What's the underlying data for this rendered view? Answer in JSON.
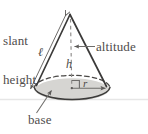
{
  "figure": {
    "type": "geometry-diagram",
    "shape": "cone",
    "background_color": "#ffffff"
  },
  "labels": {
    "slant_height_line1": "slant",
    "slant_height_line2": "height",
    "altitude": "altitude",
    "base": "base",
    "slant_symbol": "ℓ",
    "height_symbol": "h",
    "radius_symbol": "r"
  },
  "colors": {
    "outline": "#3b3a39",
    "base_fill": "#d6d5d2",
    "base_fill_edge": "#c9c8c5",
    "dashed_line": "#8e8c8a",
    "leader_line": "#6e6c6a",
    "text": "#4f4d4c",
    "ground_line": "#e4e4e4"
  },
  "geometry": {
    "apex": {
      "x": 70,
      "y": 14
    },
    "base_center": {
      "x": 72,
      "y": 88
    },
    "base_rx": 38,
    "base_ry": 13,
    "ground_line_y": 99
  },
  "annotations": [
    {
      "name": "slant-height",
      "points_to": "apex-left-edge",
      "arrowheads": "both"
    },
    {
      "name": "altitude",
      "points_to": "vertical-dashed-axis",
      "arrowheads": "one"
    },
    {
      "name": "base",
      "points_to": "base-ellipse",
      "arrowheads": "one"
    },
    {
      "name": "radius",
      "points_to": "base-center-to-right-edge",
      "arrowheads": "one"
    },
    {
      "name": "right-angle-marker",
      "at": "base-center"
    }
  ]
}
